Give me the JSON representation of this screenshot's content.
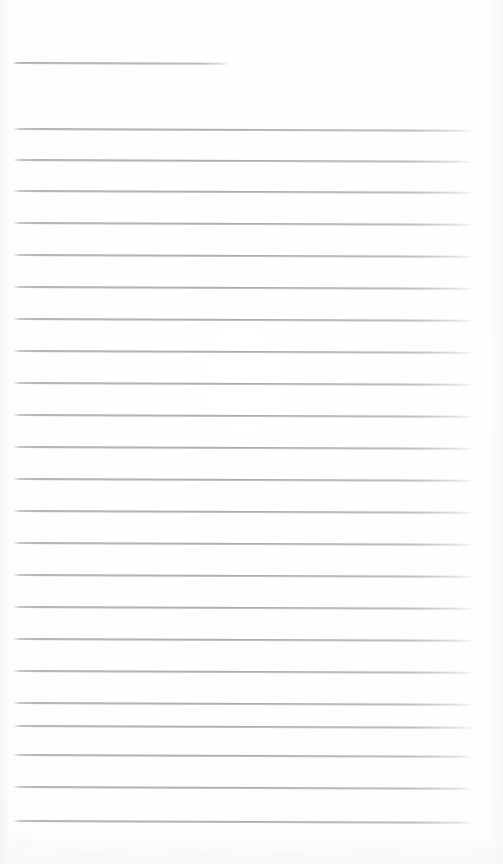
{
  "document": {
    "kind": "scanned-lined-notebook-page",
    "page_label": "",
    "background_color": "#fefefe",
    "rule_color": "#a2a7ae",
    "smudge_color": "#f2f2f4",
    "width_px": 503,
    "height_px": 864,
    "body_text": "",
    "handwriting_text": "",
    "notes_placeholder": ""
  },
  "ruling": {
    "left_margin_px": 13,
    "right_edge_px": 474,
    "line_spacing_px": 31.7,
    "tilt_deg": 0.22,
    "header_rule": {
      "y": 62,
      "x_start": 13,
      "x_end": 230,
      "label": "header-rule"
    },
    "lines": [
      {
        "y": 128,
        "x_start": 13,
        "x_end": 474
      },
      {
        "y": 158.5,
        "x_start": 13,
        "x_end": 474
      },
      {
        "y": 190,
        "x_start": 13,
        "x_end": 474
      },
      {
        "y": 222,
        "x_start": 13,
        "x_end": 474
      },
      {
        "y": 254,
        "x_start": 13,
        "x_end": 474
      },
      {
        "y": 286,
        "x_start": 13,
        "x_end": 474
      },
      {
        "y": 318,
        "x_start": 13,
        "x_end": 474
      },
      {
        "y": 350,
        "x_start": 13,
        "x_end": 474
      },
      {
        "y": 382,
        "x_start": 13,
        "x_end": 474
      },
      {
        "y": 414,
        "x_start": 13,
        "x_end": 474
      },
      {
        "y": 446,
        "x_start": 13,
        "x_end": 474
      },
      {
        "y": 478,
        "x_start": 13,
        "x_end": 474
      },
      {
        "y": 510,
        "x_start": 13,
        "x_end": 474
      },
      {
        "y": 542,
        "x_start": 13,
        "x_end": 474
      },
      {
        "y": 574,
        "x_start": 13,
        "x_end": 474
      },
      {
        "y": 606,
        "x_start": 13,
        "x_end": 474
      },
      {
        "y": 638,
        "x_start": 13,
        "x_end": 474
      },
      {
        "y": 670,
        "x_start": 13,
        "x_end": 474
      },
      {
        "y": 702,
        "x_start": 13,
        "x_end": 474
      },
      {
        "y": 725,
        "x_start": 13,
        "x_end": 474
      },
      {
        "y": 754,
        "x_start": 13,
        "x_end": 474
      },
      {
        "y": 786,
        "x_start": 13,
        "x_end": 474
      },
      {
        "y": 820,
        "x_start": 13,
        "x_end": 474
      }
    ]
  },
  "artifacts": {
    "smudges": [
      {
        "x": 352,
        "y": 340,
        "w": 118,
        "h": 11,
        "opacity": 0.3,
        "name": "scan-smudge-upper-right"
      },
      {
        "x": 8,
        "y": 836,
        "w": 30,
        "h": 14,
        "opacity": 0.34,
        "name": "scan-smudge-bottom-left"
      },
      {
        "x": 46,
        "y": 848,
        "w": 96,
        "h": 14,
        "opacity": 0.26,
        "name": "scan-smudge-bottom-a"
      },
      {
        "x": 160,
        "y": 846,
        "w": 82,
        "h": 16,
        "opacity": 0.24,
        "name": "scan-smudge-bottom-b"
      },
      {
        "x": 255,
        "y": 850,
        "w": 70,
        "h": 13,
        "opacity": 0.2,
        "name": "scan-smudge-bottom-c"
      },
      {
        "x": 340,
        "y": 845,
        "w": 64,
        "h": 14,
        "opacity": 0.22,
        "name": "scan-smudge-bottom-d"
      },
      {
        "x": 12,
        "y": 6,
        "w": 6,
        "h": 6,
        "opacity": 0.18,
        "name": "scan-speck-top-left"
      },
      {
        "x": 64,
        "y": 3,
        "w": 7,
        "h": 5,
        "opacity": 0.16,
        "name": "scan-speck-top-a"
      },
      {
        "x": 388,
        "y": 30,
        "w": 5,
        "h": 5,
        "opacity": 0.15,
        "name": "scan-speck-top-right"
      },
      {
        "x": 2,
        "y": 480,
        "w": 7,
        "h": 10,
        "opacity": 0.18,
        "name": "scan-speck-left-mid"
      },
      {
        "x": 469,
        "y": 560,
        "w": 8,
        "h": 9,
        "opacity": 0.15,
        "name": "scan-speck-right-mid"
      },
      {
        "x": 228,
        "y": 796,
        "w": 26,
        "h": 8,
        "opacity": 0.16,
        "name": "scan-speck-lower-center"
      }
    ]
  }
}
